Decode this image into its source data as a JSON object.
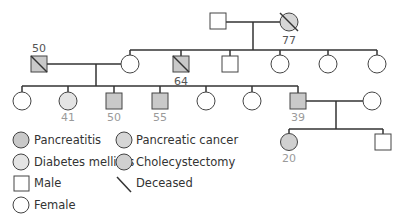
{
  "colors": {
    "line": "#333333",
    "pancreatitis": "#c9c9c9",
    "diabetes": "#e4e4e4",
    "pancreatic_cancer": "#d6d6d6",
    "cholecystectomy": "#d0d0d0",
    "unaffected": "#ffffff"
  },
  "generations": {
    "g1": [
      {
        "sex": "male",
        "status": "unaffected",
        "label": ""
      },
      {
        "sex": "female",
        "status": "pancreatic_cancer",
        "deceased": true,
        "label": "77"
      }
    ],
    "g2": [
      {
        "sex": "male",
        "status": "pancreatitis",
        "deceased": true,
        "label": "50",
        "note": "married-in spouse"
      },
      {
        "sex": "female",
        "status": "unaffected",
        "label": ""
      },
      {
        "sex": "male",
        "status": "pancreatitis",
        "deceased": true,
        "label": "64"
      },
      {
        "sex": "male",
        "status": "unaffected",
        "label": ""
      },
      {
        "sex": "female",
        "status": "unaffected",
        "label": ""
      },
      {
        "sex": "female",
        "status": "unaffected",
        "label": ""
      },
      {
        "sex": "female",
        "status": "unaffected",
        "label": ""
      }
    ],
    "g3": [
      {
        "sex": "female",
        "status": "unaffected",
        "label": ""
      },
      {
        "sex": "female",
        "status": "diabetes",
        "label": "41"
      },
      {
        "sex": "male",
        "status": "pancreatitis",
        "label": "50"
      },
      {
        "sex": "male",
        "status": "pancreatitis",
        "label": "55"
      },
      {
        "sex": "female",
        "status": "unaffected",
        "label": ""
      },
      {
        "sex": "female",
        "status": "unaffected",
        "label": ""
      },
      {
        "sex": "male",
        "status": "pancreatitis",
        "label": "39"
      },
      {
        "sex": "female",
        "status": "unaffected",
        "label": "",
        "note": "spouse"
      }
    ],
    "g4": [
      {
        "sex": "female",
        "status": "cholecystectomy",
        "label": "20"
      },
      {
        "sex": "male",
        "status": "unaffected",
        "label": ""
      }
    ]
  },
  "legend": {
    "pancreatitis": "Pancreatitis",
    "pancreatic_cancer": "Pancreatic cancer",
    "diabetes": "Diabetes mellitus",
    "cholecystectomy": "Cholecystectomy",
    "male": "Male",
    "deceased": "Deceased",
    "female": "Female"
  }
}
